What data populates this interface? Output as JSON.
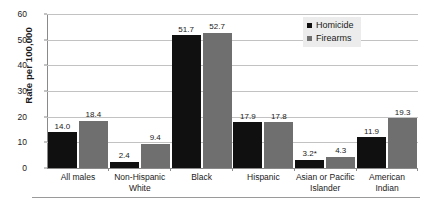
{
  "chart_data": {
    "type": "bar",
    "title": "",
    "subtitle": "",
    "xlabel": "",
    "ylabel": "Rate per 100,000",
    "ylim": [
      0,
      60
    ],
    "yticks": [
      0,
      10,
      20,
      30,
      40,
      50,
      60
    ],
    "ytick_labels": [
      "0",
      "10",
      "20",
      "30",
      "40",
      "50",
      "60"
    ],
    "grid": "horizontal",
    "legend_position": "top-right",
    "categories": [
      "All males",
      "Non-Hispanic White",
      "Black",
      "Hispanic",
      "Asian or Pacific Islander",
      "American Indian"
    ],
    "category_lines": [
      [
        "All males"
      ],
      [
        "Non-Hispanic",
        "White"
      ],
      [
        "Black"
      ],
      [
        "Hispanic"
      ],
      [
        "Asian or Pacific",
        "Islander"
      ],
      [
        "American",
        "Indian"
      ]
    ],
    "series": [
      {
        "name": "Homicide",
        "color": "#101010",
        "values": [
          14.0,
          2.4,
          51.7,
          17.9,
          3.2,
          11.9
        ],
        "labels": [
          "14.0",
          "2.4",
          "51.7",
          "17.9",
          "3.2*",
          "11.9"
        ]
      },
      {
        "name": "Firearms",
        "color": "#6f6f6f",
        "values": [
          18.4,
          9.4,
          52.7,
          17.8,
          4.3,
          19.3
        ],
        "labels": [
          "18.4",
          "9.4",
          "52.7",
          "17.8",
          "4.3",
          "19.3"
        ]
      }
    ],
    "footnote_marker": "*"
  },
  "legend": {
    "items": [
      {
        "label": "Homicide",
        "color": "#101010"
      },
      {
        "label": "Firearms",
        "color": "#6f6f6f"
      }
    ]
  }
}
